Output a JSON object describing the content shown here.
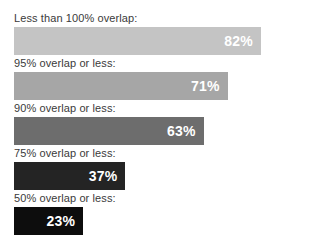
{
  "top_clipped_text": "",
  "chart_data": {
    "type": "bar",
    "orientation": "horizontal",
    "title": "",
    "xlabel": "",
    "ylabel": "",
    "xlim": [
      0,
      100
    ],
    "grid": false,
    "legend": null,
    "value_suffix": "%",
    "categories": [
      "Less than 100% overlap:",
      "95% overlap or less:",
      "90% overlap or less:",
      "75% overlap or less:",
      "50% overlap or less:"
    ],
    "values": [
      82,
      71,
      63,
      37,
      23
    ],
    "value_labels": [
      "82%",
      "71%",
      "63%",
      "37%",
      "23%"
    ],
    "bar_colors": [
      "#c4c4c4",
      "#a6a6a6",
      "#6d6d6d",
      "#242424",
      "#0d0d0d"
    ],
    "value_label_color": "#ffffff",
    "category_label_color": "#3a3a3a",
    "background": "#ffffff"
  }
}
